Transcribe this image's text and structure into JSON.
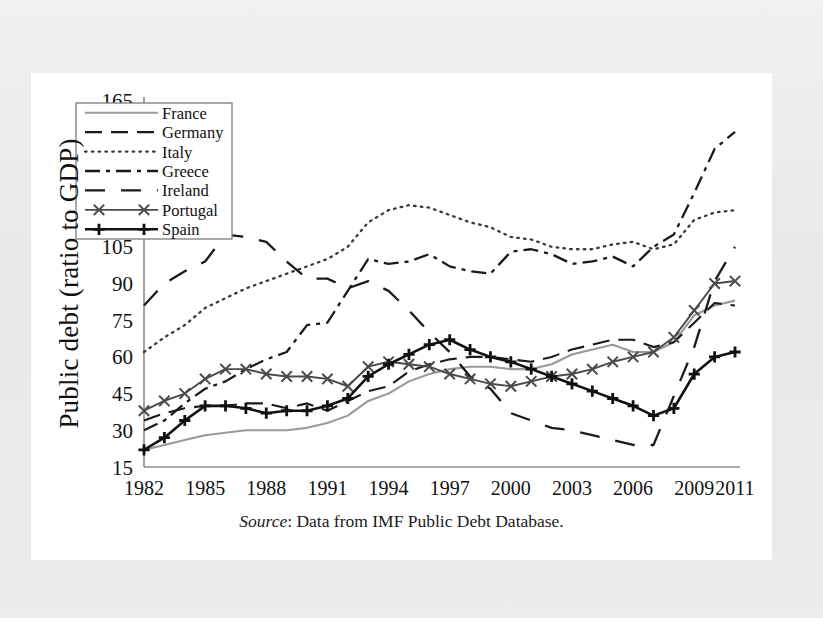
{
  "figure": {
    "ylabel": "Public debt (ratio to GDP)",
    "source_prefix": "Source",
    "source_text": ": Data from IMF Public Debt Database."
  },
  "chart_data": {
    "type": "line",
    "title": "",
    "xlabel": "",
    "ylabel": "Public debt (ratio to GDP)",
    "grid": false,
    "legend_position": "top-left",
    "xlim": [
      1982,
      2011
    ],
    "ylim": [
      15,
      165
    ],
    "ytick_values": [
      15,
      30,
      45,
      60,
      75,
      90,
      105,
      120,
      135,
      150,
      165
    ],
    "ytick_labels": [
      "15",
      "30",
      "45",
      "60",
      "75",
      "90",
      "105",
      "120",
      "135",
      "150",
      "165"
    ],
    "xtick_values": [
      1982,
      1985,
      1988,
      1991,
      1994,
      1997,
      2000,
      2003,
      2006,
      2009,
      2011
    ],
    "xtick_labels": [
      "1982",
      "1985",
      "1988",
      "1991",
      "1994",
      "1997",
      "2000",
      "2003",
      "2006",
      "2009",
      "2011"
    ],
    "x": [
      1982,
      1983,
      1984,
      1985,
      1986,
      1987,
      1988,
      1989,
      1990,
      1991,
      1992,
      1993,
      1994,
      1995,
      1996,
      1997,
      1998,
      1999,
      2000,
      2001,
      2002,
      2003,
      2004,
      2005,
      2006,
      2007,
      2008,
      2009,
      2010,
      2011
    ],
    "series": [
      {
        "name": "France",
        "style": "solid",
        "color": "#9a9a9a",
        "width": 2.1,
        "marker": "none",
        "values": [
          22,
          24,
          26,
          28,
          29,
          30,
          30,
          30,
          31,
          33,
          36,
          42,
          45,
          50,
          53,
          55,
          56,
          56,
          55,
          55,
          57,
          61,
          63,
          65,
          62,
          62,
          66,
          77,
          81,
          83
        ]
      },
      {
        "name": "Germany",
        "style": "longdash",
        "color": "#1a1a1a",
        "width": 2.1,
        "marker": "none",
        "values": [
          34,
          37,
          39,
          40,
          40,
          41,
          41,
          39,
          41,
          38,
          42,
          46,
          48,
          54,
          57,
          59,
          60,
          60,
          59,
          58,
          60,
          63,
          65,
          67,
          67,
          64,
          66,
          74,
          82,
          81
        ]
      },
      {
        "name": "Italy",
        "style": "dotted",
        "color": "#3a3a3a",
        "width": 2.3,
        "marker": "none",
        "values": [
          62,
          68,
          73,
          80,
          84,
          88,
          91,
          94,
          97,
          100,
          105,
          115,
          120,
          122,
          121,
          118,
          115,
          113,
          109,
          108,
          105,
          104,
          104,
          106,
          107,
          104,
          106,
          116,
          119,
          120
        ]
      },
      {
        "name": "Greece",
        "style": "dashdot",
        "color": "#1a1a1a",
        "width": 2.3,
        "marker": "none",
        "values": [
          30,
          34,
          41,
          47,
          50,
          55,
          59,
          62,
          73,
          74,
          87,
          100,
          98,
          99,
          102,
          97,
          95,
          94,
          103,
          104,
          102,
          98,
          99,
          101,
          97,
          105,
          110,
          127,
          145,
          152
        ]
      },
      {
        "name": "Ireland",
        "style": "widedash",
        "color": "#1a1a1a",
        "width": 2.3,
        "marker": "none",
        "values": [
          81,
          90,
          95,
          99,
          110,
          109,
          107,
          99,
          92,
          92,
          88,
          91,
          87,
          79,
          70,
          62,
          52,
          47,
          37,
          34,
          31,
          30,
          28,
          26,
          24,
          24,
          44,
          64,
          91,
          105
        ]
      },
      {
        "name": "Portugal",
        "style": "solid",
        "color": "#4a4a4a",
        "width": 1.9,
        "marker": "x",
        "values": [
          38,
          42,
          45,
          51,
          55,
          55,
          53,
          52,
          52,
          51,
          48,
          56,
          58,
          57,
          56,
          53,
          51,
          49,
          48,
          50,
          52,
          53,
          55,
          58,
          60,
          62,
          68,
          79,
          90,
          91
        ]
      },
      {
        "name": "Spain",
        "style": "solid",
        "color": "#111111",
        "width": 2.6,
        "marker": "plus",
        "values": [
          22,
          27,
          34,
          40,
          40,
          39,
          37,
          38,
          38,
          40,
          43,
          52,
          57,
          61,
          65,
          67,
          63,
          60,
          58,
          55,
          52,
          49,
          46,
          43,
          40,
          36,
          39,
          53,
          60,
          62
        ]
      }
    ]
  },
  "legend": {
    "entries": [
      {
        "label": "France"
      },
      {
        "label": "Germany"
      },
      {
        "label": "Italy"
      },
      {
        "label": "Greece"
      },
      {
        "label": "Ireland"
      },
      {
        "label": "Portugal"
      },
      {
        "label": "Spain"
      }
    ]
  }
}
